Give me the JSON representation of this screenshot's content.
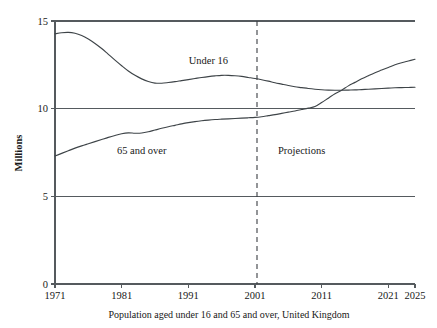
{
  "chart_data": {
    "type": "line",
    "title": "",
    "subtitle": "",
    "caption": "Population aged under 16 and 65 and over, United Kingdom",
    "xlabel": "",
    "ylabel": "Millions",
    "xlim": [
      1971,
      2025
    ],
    "ylim": [
      0,
      15
    ],
    "yticks": [
      0,
      5,
      10,
      15
    ],
    "ytick_labels": [
      "0",
      "5",
      "10",
      "15"
    ],
    "xticks": [
      1971,
      1981,
      1991,
      2001,
      2011,
      2021,
      2025
    ],
    "xtick_labels": [
      "1971",
      "1981",
      "1991",
      "2001",
      "2011",
      "2021",
      "2025"
    ],
    "grid": "horizontal",
    "legend_position": "inline-annotations",
    "annotations": [
      {
        "name": "projections-divider",
        "text": "Projections",
        "x": 2001,
        "label_x": 2008,
        "label_y": 7.4
      },
      {
        "name": "under-16-label",
        "text": "Under 16",
        "x": 1994,
        "y": 12.55
      },
      {
        "name": "65-and-over-label",
        "text": "65 and over",
        "x": 1984,
        "y": 7.4
      }
    ],
    "series": [
      {
        "name": "Under 16",
        "color": "#3e4448",
        "x": [
          1971,
          1972,
          1973,
          1974,
          1975,
          1976,
          1977,
          1978,
          1979,
          1980,
          1981,
          1982,
          1983,
          1984,
          1985,
          1986,
          1987,
          1988,
          1989,
          1990,
          1991,
          1992,
          1993,
          1994,
          1995,
          1996,
          1997,
          1998,
          1999,
          2000,
          2001,
          2002,
          2003,
          2004,
          2005,
          2006,
          2007,
          2008,
          2009,
          2010,
          2011,
          2012,
          2013,
          2014,
          2015,
          2016,
          2017,
          2018,
          2019,
          2020,
          2021,
          2022,
          2023,
          2024,
          2025
        ],
        "values": [
          14.27,
          14.33,
          14.35,
          14.3,
          14.17,
          13.97,
          13.72,
          13.43,
          13.1,
          12.77,
          12.45,
          12.15,
          11.9,
          11.7,
          11.55,
          11.46,
          11.45,
          11.49,
          11.54,
          11.6,
          11.66,
          11.72,
          11.78,
          11.83,
          11.87,
          11.9,
          11.9,
          11.88,
          11.84,
          11.78,
          11.72,
          11.65,
          11.57,
          11.48,
          11.4,
          11.32,
          11.25,
          11.2,
          11.15,
          11.11,
          11.08,
          11.06,
          11.05,
          11.05,
          11.06,
          11.07,
          11.09,
          11.11,
          11.13,
          11.15,
          11.17,
          11.19,
          11.2,
          11.21,
          11.22
        ]
      },
      {
        "name": "65 and over",
        "color": "#3e4448",
        "x": [
          1971,
          1972,
          1973,
          1974,
          1975,
          1976,
          1977,
          1978,
          1979,
          1980,
          1981,
          1982,
          1983,
          1984,
          1985,
          1986,
          1987,
          1988,
          1989,
          1990,
          1991,
          1992,
          1993,
          1994,
          1995,
          1996,
          1997,
          1998,
          1999,
          2000,
          2001,
          2002,
          2003,
          2004,
          2005,
          2006,
          2007,
          2008,
          2009,
          2010,
          2011,
          2012,
          2013,
          2014,
          2015,
          2016,
          2017,
          2018,
          2019,
          2020,
          2021,
          2022,
          2023,
          2024,
          2025
        ],
        "values": [
          7.3,
          7.45,
          7.6,
          7.75,
          7.88,
          8.0,
          8.12,
          8.24,
          8.36,
          8.47,
          8.57,
          8.62,
          8.6,
          8.61,
          8.68,
          8.78,
          8.88,
          8.97,
          9.05,
          9.13,
          9.2,
          9.26,
          9.31,
          9.35,
          9.38,
          9.4,
          9.42,
          9.44,
          9.46,
          9.48,
          9.5,
          9.54,
          9.6,
          9.66,
          9.73,
          9.8,
          9.87,
          9.95,
          10.03,
          10.12,
          10.35,
          10.6,
          10.85,
          11.05,
          11.3,
          11.5,
          11.7,
          11.88,
          12.05,
          12.2,
          12.35,
          12.5,
          12.62,
          12.72,
          12.82
        ]
      }
    ]
  }
}
